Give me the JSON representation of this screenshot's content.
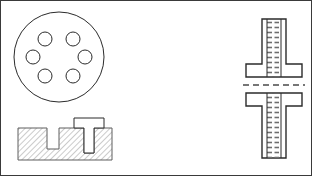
{
  "sheet": {
    "width": 312,
    "height": 176,
    "background": "#ffffff",
    "border_color": "#3a3a3a",
    "line_color": "#2b2b2b",
    "hatch_color": "#8c8c8c",
    "thread_color": "#6e6e6e",
    "title": "T-Bolt and T-Slot Engineering Drawing"
  },
  "views": {
    "bolt_head_end_view": {
      "name": "Bolt head end view",
      "outer_circle": {
        "cx": 59,
        "cy": 57,
        "r": 45
      },
      "hole_radius": 7,
      "hole_centers": [
        {
          "cx": 45,
          "cy": 39
        },
        {
          "cx": 73,
          "cy": 39
        },
        {
          "cx": 33,
          "cy": 57
        },
        {
          "cx": 85,
          "cy": 57
        },
        {
          "cx": 45,
          "cy": 76
        },
        {
          "cx": 73,
          "cy": 76
        }
      ],
      "hole_count": 6
    },
    "slot_section_view": {
      "name": "T-slot block section view",
      "block": {
        "x": 18,
        "y": 128,
        "width": 94,
        "height": 32
      },
      "open_slot": {
        "x": 47,
        "y": 128,
        "width": 12,
        "height": 21
      },
      "bolt_slot": {
        "x": 84,
        "y": 128,
        "width": 10,
        "height": 25
      },
      "bolt_head": {
        "x": 74,
        "y": 118,
        "width": 30,
        "height": 10
      },
      "hatch_angle_deg": 45,
      "hatch_spacing": 4
    },
    "tbolt_upper_view": {
      "name": "T-bolt upper elevation",
      "flange": {
        "x": 246,
        "y": 64,
        "width": 56,
        "height": 13
      },
      "stem": {
        "x": 262,
        "y": 19,
        "width": 24,
        "height": 45
      },
      "thread_core": {
        "x": 267,
        "y": 19,
        "width": 14,
        "height": 58
      },
      "thread_pitch": 5
    },
    "tbolt_lower_view": {
      "name": "T-bolt lower elevation",
      "flange": {
        "x": 246,
        "y": 93,
        "width": 56,
        "height": 13
      },
      "stem": {
        "x": 262,
        "y": 106,
        "width": 24,
        "height": 52
      },
      "thread_core": {
        "x": 267,
        "y": 93,
        "width": 14,
        "height": 65
      },
      "thread_pitch": 5
    },
    "centerline": {
      "name": "Section centerline",
      "x1": 243,
      "x2": 305,
      "y": 85,
      "dash": "6 4"
    }
  }
}
